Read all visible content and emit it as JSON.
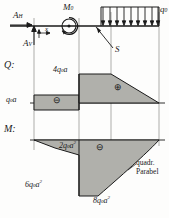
{
  "diagram": {
    "kind": "structural-mechanics-beam-diagram",
    "language": "de",
    "system": {
      "reaction_horizontal": "A",
      "reaction_horizontal_sub": "H",
      "reaction_vertical": "A",
      "reaction_vertical_sub": "V",
      "coordinate_x": "x",
      "moment_label": "M",
      "moment_sub": "0",
      "hinge_label": "S",
      "load_label": "q",
      "load_sub": "0",
      "load_arrow_count": 9
    },
    "shear_diagram": {
      "title": "Q:",
      "left_value": "q",
      "left_value_sub": "0",
      "left_value_tail": "a",
      "left_sign": "⊖",
      "peak_value": "4q",
      "peak_value_sub": "0",
      "peak_value_tail": "a",
      "right_sign": "⊕"
    },
    "moment_diagram": {
      "title": "M:",
      "value_upper": "2q",
      "value_upper_sub": "0",
      "value_upper_tail": "a",
      "value_upper_exp": "2",
      "value_left": "6q",
      "value_left_sub": "0",
      "value_left_tail": "a",
      "value_left_exp": "2",
      "value_bottom": "8q",
      "value_bottom_sub": "0",
      "value_bottom_tail": "a",
      "value_bottom_exp": "2",
      "sign": "⊖",
      "curve_note_line1": "quadr.",
      "curve_note_line2": "Parabel"
    },
    "colors": {
      "fill": "#b0b0ab",
      "stroke": "#1a1a1a",
      "guide": "#8a8a86",
      "paper": "#fdfdfc"
    }
  }
}
